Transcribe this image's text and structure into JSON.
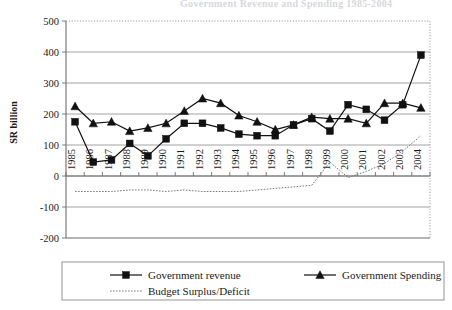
{
  "chart_data": {
    "type": "line",
    "title": "Government Revenue and Spending 1985-2004",
    "xlabel": "",
    "ylabel": "SR billion",
    "ylim": [
      -200,
      500
    ],
    "ytick_step": 100,
    "yticks": [
      500,
      400,
      300,
      200,
      100,
      0,
      -100,
      -200
    ],
    "grid": true,
    "legend_position": "bottom",
    "categories": [
      "1985",
      "1986",
      "1987",
      "1988",
      "1989",
      "1990",
      "1991",
      "1992",
      "1993",
      "1994",
      "1995",
      "1996",
      "1997",
      "1998",
      "1999",
      "2000",
      "2001",
      "2002",
      "2003",
      "2004"
    ],
    "series": [
      {
        "name": "Government revenue",
        "marker": "square",
        "values": [
          175,
          45,
          52,
          105,
          65,
          120,
          170,
          170,
          155,
          135,
          130,
          130,
          165,
          185,
          145,
          230,
          215,
          180,
          230,
          390
        ]
      },
      {
        "name": "Government Spending",
        "marker": "triangle",
        "values": [
          225,
          170,
          175,
          145,
          155,
          170,
          210,
          250,
          235,
          195,
          175,
          150,
          165,
          190,
          185,
          185,
          170,
          235,
          235,
          220
        ]
      },
      {
        "name": "Budget Surplus/Deficit",
        "marker": "none",
        "values": [
          -50,
          -50,
          -50,
          -45,
          -45,
          -50,
          -45,
          -50,
          -50,
          -50,
          -45,
          -40,
          -35,
          -30,
          45,
          -5,
          15,
          40,
          80,
          130
        ]
      }
    ]
  },
  "legend": {
    "items": [
      {
        "label": "Government revenue",
        "marker": "square"
      },
      {
        "label": "Government Spending",
        "marker": "triangle"
      },
      {
        "label": "Budget Surplus/Deficit",
        "marker": "dotted"
      }
    ]
  },
  "axes": {
    "y_title": "SR billion"
  }
}
